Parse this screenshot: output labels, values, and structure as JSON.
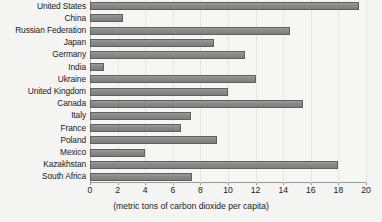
{
  "chart_data": {
    "type": "bar",
    "orientation": "horizontal",
    "title": "",
    "xlabel": "(metric tons of carbon dioxide per capita)",
    "ylabel": "",
    "xlim": [
      0,
      20
    ],
    "xticks": [
      0,
      2,
      4,
      6,
      8,
      10,
      12,
      14,
      16,
      18,
      20
    ],
    "grid": true,
    "legend": "none",
    "categories": [
      "United States",
      "China",
      "Russian Federation",
      "Japan",
      "Germany",
      "India",
      "Ukraine",
      "United Kingdom",
      "Canada",
      "Italy",
      "France",
      "Poland",
      "Mexico",
      "Kazakhstan",
      "South Africa"
    ],
    "values": [
      19.5,
      2.4,
      14.5,
      9.0,
      11.2,
      1.0,
      12.0,
      10.0,
      15.4,
      7.3,
      6.6,
      9.2,
      4.0,
      18.0,
      7.4
    ],
    "colors": {
      "bar_fill": "#8a8a8a",
      "bar_edge": "#5f5f5f",
      "background": "#f6f6f4",
      "gridline": "#e6e6e2",
      "axis": "#9a9a96",
      "text": "#1a1a1a"
    }
  }
}
